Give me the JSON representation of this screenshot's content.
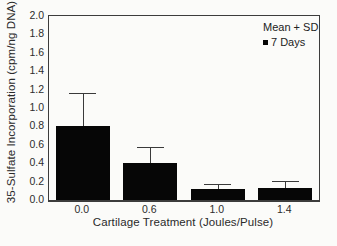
{
  "chart_data": {
    "type": "bar",
    "title": "",
    "categories": [
      "0.0",
      "0.6",
      "1.0",
      "1.4"
    ],
    "series": [
      {
        "name": "7 Days",
        "values": [
          0.8,
          0.4,
          0.12,
          0.13
        ],
        "error_cap_values": [
          1.15,
          0.56,
          0.16,
          0.2
        ]
      }
    ],
    "xlabel": "Cartilage Treatment (Joules/Pulse)",
    "ylabel": "35-Sulfate Incorporation (cpm/ng DNA)",
    "ylim": [
      0.0,
      2.0
    ],
    "yticks": [
      "0.0",
      "0.2",
      "0.4",
      "0.6",
      "0.8",
      "1.0",
      "1.2",
      "1.4",
      "1.6",
      "1.8",
      "2.0"
    ],
    "grid": false,
    "bar_color": "#060606",
    "axis_color": "#3c3c3c",
    "error_bar_color": "#3a3a3a",
    "background_color": "#fbfbf9",
    "legend": {
      "position": "top-right",
      "title": "Mean + SD",
      "entries": [
        {
          "marker": "black-square",
          "label": "7 Days"
        }
      ]
    }
  }
}
